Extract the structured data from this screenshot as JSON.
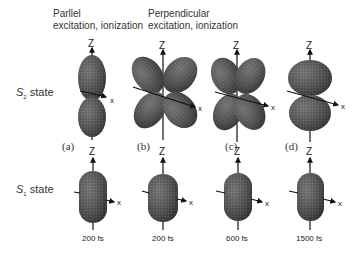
{
  "headers": {
    "parallel": {
      "line1": "Parllel",
      "line2": "excitation, ionization"
    },
    "perpendicular": {
      "line1": "Perpendicular",
      "line2": "excitation, ionization"
    }
  },
  "rows": [
    {
      "state_symbol": "S",
      "state_sub": "2",
      "state_word": "state"
    },
    {
      "state_symbol": "S",
      "state_sub": "1",
      "state_word": "state"
    }
  ],
  "panels": [
    {
      "label": "(a)",
      "time": "200 fs"
    },
    {
      "label": "(b)",
      "time": "200 fs"
    },
    {
      "label": "(c)",
      "time": "600 fs"
    },
    {
      "label": "(d)",
      "time": "1500 fs"
    }
  ],
  "axes": {
    "z": "Z",
    "x": "x"
  },
  "colors": {
    "surface": "#3a3a3a",
    "mesh": "#8a8a8a",
    "axis": "#111111",
    "background": "#ffffff"
  }
}
